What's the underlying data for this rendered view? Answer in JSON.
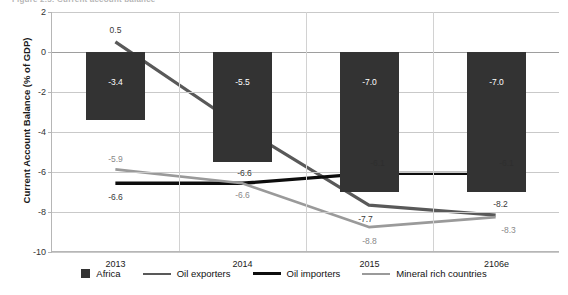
{
  "title_sliver": "Figure 2.5: Current account balance",
  "axes": {
    "ylabel": "Current Account Balance  (% of GDP)",
    "yticks": [
      "2",
      "0",
      "-2",
      "-4",
      "-6",
      "-8",
      "-10"
    ],
    "xticks": [
      "2013",
      "2014",
      "2015",
      "2106e"
    ]
  },
  "legend": {
    "items": [
      {
        "label": "Africa",
        "marker": "bar-swatch",
        "color": "#333333"
      },
      {
        "label": "Oil exporters",
        "marker": "line-swatch",
        "color": "#595959"
      },
      {
        "label": "Oil importers",
        "marker": "line-swatch",
        "color": "#0d0d0d"
      },
      {
        "label": "Mineral rich countries",
        "marker": "line-swatch",
        "color": "#9a9a9a"
      }
    ]
  },
  "chart_data": {
    "type": "bar",
    "title": "Figure 2.5: Current account balance",
    "xlabel": "",
    "ylabel": "Current Account Balance  (% of GDP)",
    "ylim": [
      -10,
      2
    ],
    "ytick_step": 2,
    "grid": true,
    "legend_position": "bottom",
    "categories": [
      "2013",
      "2014",
      "2015",
      "2106e"
    ],
    "series": [
      {
        "name": "Africa",
        "type": "bar",
        "color": "#333333",
        "values": [
          -3.4,
          -5.5,
          -7.0,
          -7.0
        ],
        "labels": [
          "-3.4",
          "-5.5",
          "-7.0",
          "-7.0"
        ]
      },
      {
        "name": "Oil exporters",
        "type": "line",
        "color": "#595959",
        "values": [
          0.5,
          -3.8,
          -7.7,
          -8.2
        ],
        "labels": [
          "0.5",
          "",
          "-7.7",
          "-8.2"
        ]
      },
      {
        "name": "Oil importers",
        "type": "line",
        "color": "#0d0d0d",
        "values": [
          -6.6,
          -6.6,
          -6.1,
          -6.1
        ],
        "labels": [
          "-6.6",
          "-6.6",
          "-6.1",
          "-6.1"
        ]
      },
      {
        "name": "Mineral rich countries",
        "type": "line",
        "color": "#9a9a9a",
        "values": [
          -5.9,
          -6.6,
          -8.8,
          -8.3
        ],
        "labels": [
          "-5.9",
          "-6.6",
          "-8.8",
          "-8.3"
        ]
      }
    ]
  }
}
